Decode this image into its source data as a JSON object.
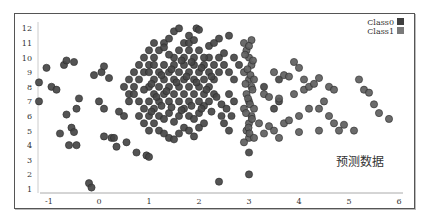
{
  "chart_data": {
    "type": "scatter",
    "title": "",
    "xlabel": "",
    "ylabel": "",
    "xlim": [
      -1.2,
      6.1
    ],
    "ylim": [
      0.8,
      12.4
    ],
    "x_ticks": [
      -1,
      0,
      1,
      2,
      3,
      4,
      5,
      6
    ],
    "y_ticks": [
      1,
      2,
      3,
      4,
      5,
      6,
      7,
      8,
      9,
      10,
      11,
      12
    ],
    "grid": false,
    "legend_position": "top-right",
    "annotation": "预测数据",
    "series": [
      {
        "name": "Class0",
        "color": "#454545",
        "points": [
          [
            -1.2,
            8.3
          ],
          [
            -1.2,
            7.0
          ],
          [
            -1.05,
            9.3
          ],
          [
            -0.95,
            8.0
          ],
          [
            -0.85,
            7.8
          ],
          [
            -0.7,
            9.5
          ],
          [
            -0.65,
            9.8
          ],
          [
            -0.5,
            9.7
          ],
          [
            -0.78,
            4.8
          ],
          [
            -0.65,
            6.1
          ],
          [
            -0.55,
            5.2
          ],
          [
            -0.5,
            4.9
          ],
          [
            -0.6,
            4.0
          ],
          [
            -0.45,
            4.0
          ],
          [
            -0.45,
            6.5
          ],
          [
            -0.4,
            7.2
          ],
          [
            -0.2,
            1.4
          ],
          [
            -0.15,
            1.1
          ],
          [
            -0.1,
            8.8
          ],
          [
            0.05,
            9.0
          ],
          [
            0.1,
            9.4
          ],
          [
            0.2,
            8.6
          ],
          [
            0.0,
            7.0
          ],
          [
            0.1,
            6.5
          ],
          [
            0.1,
            4.6
          ],
          [
            0.25,
            4.5
          ],
          [
            0.3,
            4.5
          ],
          [
            0.35,
            3.9
          ],
          [
            0.55,
            4.2
          ],
          [
            0.75,
            3.5
          ],
          [
            0.95,
            3.3
          ],
          [
            1.0,
            3.2
          ],
          [
            0.4,
            6.3
          ],
          [
            0.5,
            6.0
          ],
          [
            0.6,
            7.5
          ],
          [
            0.7,
            8.0
          ],
          [
            0.8,
            8.5
          ],
          [
            0.9,
            9.0
          ],
          [
            1.0,
            9.5
          ],
          [
            1.1,
            10.0
          ],
          [
            1.2,
            10.5
          ],
          [
            1.3,
            11.0
          ],
          [
            1.4,
            11.3
          ],
          [
            1.5,
            11.8
          ],
          [
            1.6,
            12.0
          ],
          [
            1.8,
            11.5
          ],
          [
            1.95,
            12.0
          ],
          [
            2.0,
            11.9
          ],
          [
            0.5,
            8.0
          ],
          [
            0.6,
            8.5
          ],
          [
            0.7,
            9.0
          ],
          [
            0.8,
            9.5
          ],
          [
            0.9,
            10.0
          ],
          [
            1.0,
            10.5
          ],
          [
            1.1,
            11.0
          ],
          [
            1.3,
            10.7
          ],
          [
            0.6,
            7.0
          ],
          [
            0.7,
            7.5
          ],
          [
            0.8,
            7.0
          ],
          [
            0.9,
            6.5
          ],
          [
            1.0,
            6.0
          ],
          [
            1.1,
            5.5
          ],
          [
            1.2,
            5.0
          ],
          [
            1.3,
            4.8
          ],
          [
            1.4,
            4.5
          ],
          [
            1.5,
            4.4
          ],
          [
            1.6,
            4.8
          ],
          [
            1.7,
            5.2
          ],
          [
            1.8,
            5.0
          ],
          [
            1.9,
            4.6
          ],
          [
            2.0,
            5.2
          ],
          [
            2.1,
            5.5
          ],
          [
            0.8,
            6.0
          ],
          [
            0.9,
            5.5
          ],
          [
            1.0,
            5.0
          ],
          [
            1.1,
            6.5
          ],
          [
            1.2,
            6.0
          ],
          [
            1.3,
            5.8
          ],
          [
            1.4,
            6.2
          ],
          [
            1.5,
            5.6
          ],
          [
            1.6,
            6.0
          ],
          [
            1.7,
            6.5
          ],
          [
            1.8,
            6.0
          ],
          [
            1.9,
            5.8
          ],
          [
            2.0,
            6.2
          ],
          [
            2.1,
            6.7
          ],
          [
            2.2,
            7.0
          ],
          [
            2.3,
            7.5
          ],
          [
            1.0,
            7.0
          ],
          [
            1.1,
            7.5
          ],
          [
            1.2,
            7.0
          ],
          [
            1.3,
            7.5
          ],
          [
            1.4,
            7.0
          ],
          [
            1.5,
            7.5
          ],
          [
            1.6,
            7.0
          ],
          [
            1.7,
            7.5
          ],
          [
            1.8,
            7.0
          ],
          [
            1.9,
            7.5
          ],
          [
            2.0,
            7.0
          ],
          [
            2.1,
            7.5
          ],
          [
            2.2,
            8.0
          ],
          [
            2.3,
            8.5
          ],
          [
            2.4,
            9.0
          ],
          [
            2.5,
            9.5
          ],
          [
            1.0,
            8.0
          ],
          [
            1.1,
            8.5
          ],
          [
            1.2,
            8.0
          ],
          [
            1.3,
            8.5
          ],
          [
            1.4,
            8.0
          ],
          [
            1.5,
            8.5
          ],
          [
            1.6,
            8.0
          ],
          [
            1.7,
            8.5
          ],
          [
            1.8,
            8.0
          ],
          [
            1.9,
            8.5
          ],
          [
            2.0,
            8.0
          ],
          [
            2.1,
            8.5
          ],
          [
            2.2,
            9.0
          ],
          [
            2.3,
            9.5
          ],
          [
            2.4,
            10.0
          ],
          [
            2.5,
            10.3
          ],
          [
            1.0,
            9.0
          ],
          [
            1.1,
            9.5
          ],
          [
            1.2,
            9.0
          ],
          [
            1.3,
            9.5
          ],
          [
            1.4,
            9.0
          ],
          [
            1.5,
            9.5
          ],
          [
            1.6,
            9.0
          ],
          [
            1.7,
            9.5
          ],
          [
            1.8,
            9.0
          ],
          [
            1.9,
            9.5
          ],
          [
            2.0,
            9.0
          ],
          [
            2.1,
            9.5
          ],
          [
            2.2,
            10.0
          ],
          [
            1.5,
            10.0
          ],
          [
            1.6,
            10.5
          ],
          [
            1.7,
            10.0
          ],
          [
            1.8,
            10.5
          ],
          [
            1.9,
            10.0
          ],
          [
            2.0,
            10.5
          ],
          [
            2.1,
            10.0
          ],
          [
            1.4,
            10.2
          ],
          [
            1.7,
            11.0
          ],
          [
            1.8,
            11.0
          ],
          [
            1.9,
            11.2
          ],
          [
            0.9,
            7.8
          ],
          [
            1.05,
            8.2
          ],
          [
            1.25,
            8.8
          ],
          [
            1.45,
            9.2
          ],
          [
            1.65,
            9.8
          ],
          [
            1.85,
            9.7
          ],
          [
            2.05,
            9.3
          ],
          [
            2.25,
            8.7
          ],
          [
            1.15,
            7.3
          ],
          [
            1.35,
            7.7
          ],
          [
            1.55,
            8.3
          ],
          [
            1.75,
            8.7
          ],
          [
            1.95,
            8.3
          ],
          [
            2.15,
            7.8
          ],
          [
            2.35,
            7.3
          ],
          [
            2.45,
            6.8
          ],
          [
            1.05,
            6.3
          ],
          [
            1.25,
            6.7
          ],
          [
            1.45,
            6.6
          ],
          [
            1.65,
            6.4
          ],
          [
            1.85,
            6.7
          ],
          [
            2.05,
            6.5
          ],
          [
            2.25,
            6.3
          ],
          [
            2.45,
            6.0
          ],
          [
            2.6,
            9.0
          ],
          [
            2.7,
            8.5
          ],
          [
            2.6,
            7.5
          ],
          [
            2.7,
            7.0
          ],
          [
            2.55,
            6.5
          ],
          [
            2.65,
            6.0
          ],
          [
            2.5,
            5.5
          ],
          [
            2.6,
            5.0
          ],
          [
            2.4,
            11.3
          ],
          [
            2.6,
            11.5
          ],
          [
            2.2,
            10.8
          ],
          [
            2.3,
            11.0
          ],
          [
            2.7,
            10.0
          ],
          [
            2.8,
            9.5
          ],
          [
            2.4,
            1.5
          ],
          [
            3.0,
            2.0
          ],
          [
            3.0,
            3.5
          ],
          [
            3.5,
            6.5
          ],
          [
            3.6,
            8.5
          ],
          [
            3.6,
            7.0
          ],
          [
            3.3,
            8.0
          ]
        ]
      },
      {
        "name": "Class1",
        "color": "#5e5e5e",
        "points": [
          [
            2.9,
            11.0
          ],
          [
            2.95,
            10.5
          ],
          [
            3.0,
            10.0
          ],
          [
            3.05,
            9.5
          ],
          [
            2.9,
            9.0
          ],
          [
            3.0,
            8.5
          ],
          [
            3.05,
            8.0
          ],
          [
            2.95,
            7.5
          ],
          [
            3.0,
            7.0
          ],
          [
            2.9,
            6.5
          ],
          [
            3.05,
            6.0
          ],
          [
            3.0,
            5.5
          ],
          [
            2.95,
            5.0
          ],
          [
            3.0,
            4.5
          ],
          [
            2.9,
            4.2
          ],
          [
            3.05,
            11.2
          ],
          [
            3.0,
            10.8
          ],
          [
            2.92,
            10.2
          ],
          [
            3.08,
            9.8
          ],
          [
            2.97,
            9.2
          ],
          [
            3.03,
            8.8
          ],
          [
            2.93,
            8.2
          ],
          [
            3.07,
            7.8
          ],
          [
            2.98,
            7.2
          ],
          [
            3.02,
            6.8
          ],
          [
            2.94,
            6.2
          ],
          [
            3.06,
            5.8
          ],
          [
            2.99,
            5.2
          ],
          [
            3.01,
            4.8
          ],
          [
            3.1,
            4.5
          ],
          [
            3.1,
            6.5
          ],
          [
            3.1,
            8.5
          ],
          [
            3.5,
            9.0
          ],
          [
            3.7,
            8.8
          ],
          [
            3.8,
            8.7
          ],
          [
            3.3,
            7.5
          ],
          [
            3.4,
            7.3
          ],
          [
            3.6,
            7.2
          ],
          [
            3.9,
            7.5
          ],
          [
            4.1,
            7.8
          ],
          [
            3.2,
            5.5
          ],
          [
            3.4,
            5.3
          ],
          [
            3.5,
            5.0
          ],
          [
            3.3,
            4.8
          ],
          [
            3.7,
            5.5
          ],
          [
            3.8,
            5.7
          ],
          [
            4.0,
            6.0
          ],
          [
            4.2,
            6.5
          ],
          [
            3.9,
            9.7
          ],
          [
            4.0,
            9.3
          ],
          [
            4.1,
            8.5
          ],
          [
            4.2,
            8.0
          ],
          [
            4.3,
            8.2
          ],
          [
            4.4,
            8.6
          ],
          [
            4.6,
            8.0
          ],
          [
            4.7,
            7.8
          ],
          [
            4.5,
            7.0
          ],
          [
            4.4,
            6.5
          ],
          [
            4.6,
            6.0
          ],
          [
            4.7,
            5.5
          ],
          [
            4.4,
            5.0
          ],
          [
            4.8,
            5.0
          ],
          [
            4.9,
            5.4
          ],
          [
            5.1,
            5.0
          ],
          [
            5.2,
            8.5
          ],
          [
            5.3,
            7.8
          ],
          [
            5.4,
            7.6
          ],
          [
            5.6,
            6.2
          ],
          [
            5.8,
            5.8
          ],
          [
            5.5,
            6.8
          ],
          [
            4.0,
            4.9
          ],
          [
            3.6,
            4.5
          ]
        ]
      }
    ]
  }
}
